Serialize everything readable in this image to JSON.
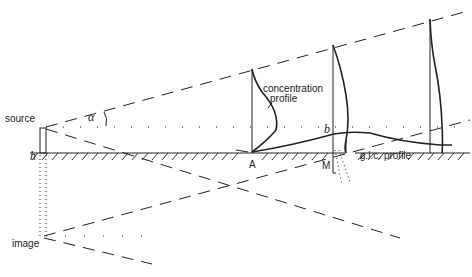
{
  "diagram": {
    "type": "plume dispersion schematic (Gaussian plume with image source)",
    "labels": {
      "source": "source",
      "image": "image",
      "alpha": "α",
      "height": "h",
      "concentration_profile_line1": "concentration",
      "concentration_profile_line2": "profile",
      "b": "b",
      "glc_profile": "g.l.c. profile",
      "A": "A",
      "M": "M"
    },
    "colors": {
      "line": "#222222",
      "background": "#ffffff"
    }
  }
}
